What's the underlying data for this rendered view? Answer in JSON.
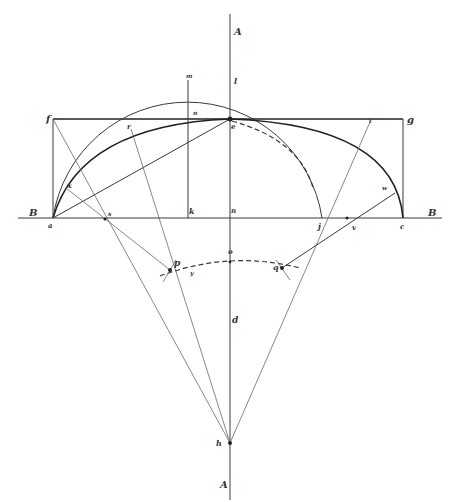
{
  "diagram": {
    "type": "geometric-construction",
    "colors": {
      "ink": "#3a3a3a",
      "background": "#ffffff"
    },
    "labels": {
      "A_top": "A",
      "A_bottom": "A",
      "B_left": "B",
      "B_right": "B",
      "a": "a",
      "c": "c",
      "e": "e",
      "f": "f",
      "g": "g",
      "h": "h",
      "j": "j",
      "k": "k",
      "l": "l",
      "m": "m",
      "n": "n",
      "o": "o",
      "p": "p",
      "q": "q",
      "r": "r",
      "s": "s",
      "t": "t",
      "u": "u",
      "v": "v",
      "w": "w",
      "x": "x",
      "d": "d",
      "y": "y",
      "center": "n"
    }
  }
}
